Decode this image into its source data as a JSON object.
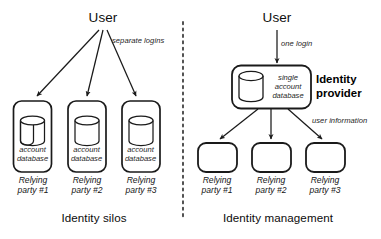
{
  "figure": {
    "title_left": "Identity silos",
    "title_right": "Identity management",
    "divider": "vertical-dashed-divider"
  },
  "left_panel": {
    "actor": "User",
    "flow_annotation": "separate logins",
    "caption": "Identity silos",
    "silos": [
      {
        "database_label_line1": "account",
        "database_label_line2": "database",
        "party_label_line1": "Relying",
        "party_label_line2": "party #1"
      },
      {
        "database_label_line1": "account",
        "database_label_line2": "database",
        "party_label_line1": "Relying",
        "party_label_line2": "party #2"
      },
      {
        "database_label_line1": "account",
        "database_label_line2": "database",
        "party_label_line1": "Relying",
        "party_label_line2": "party #3"
      }
    ]
  },
  "right_panel": {
    "actor": "User",
    "login_annotation": "one login",
    "provider": {
      "database_label_line1": "single",
      "database_label_line2": "account",
      "database_label_line3": "database",
      "name_line1": "Identity",
      "name_line2": "provider"
    },
    "distribution_annotation": "user information",
    "caption": "Identity management",
    "relying_parties": [
      {
        "party_label_line1": "Relying",
        "party_label_line2": "party #1"
      },
      {
        "party_label_line1": "Relying",
        "party_label_line2": "party #2"
      },
      {
        "party_label_line1": "Relying",
        "party_label_line2": "party #3"
      }
    ]
  },
  "colors": {
    "stroke": "#1a1a1a",
    "background": "#ffffff",
    "text": "#111111"
  }
}
